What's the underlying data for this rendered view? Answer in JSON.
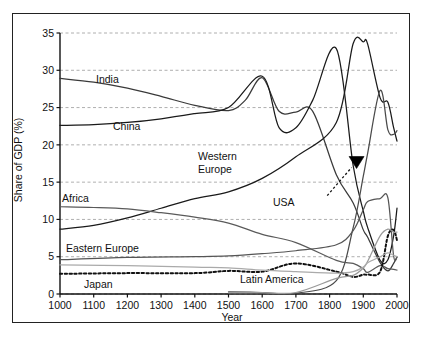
{
  "chart_data": {
    "type": "line",
    "title": "",
    "xlabel": "Year",
    "ylabel": "Share of GDP (%)",
    "xlim": [
      1000,
      2000
    ],
    "ylim": [
      0,
      35
    ],
    "xticks": [
      1000,
      1100,
      1200,
      1300,
      1400,
      1500,
      1600,
      1700,
      1800,
      1900,
      2000
    ],
    "yticks": [
      0,
      5,
      10,
      15,
      20,
      25,
      30,
      35
    ],
    "grid": "horizontal-dashed",
    "legend": "inline-annotations",
    "series": [
      {
        "name": "India",
        "label": "India",
        "style": "solid",
        "color": "#3a3a3a",
        "x": [
          1000,
          1100,
          1200,
          1300,
          1400,
          1500,
          1550,
          1600,
          1650,
          1700,
          1750,
          1820,
          1870,
          1900,
          1913,
          1950,
          1973,
          1990,
          2000
        ],
        "values": [
          28.9,
          28.4,
          27.6,
          26.5,
          25.3,
          24.6,
          26.0,
          29.0,
          24.5,
          24.4,
          24.5,
          16.0,
          12.2,
          8.6,
          7.6,
          4.2,
          3.1,
          4.1,
          5.0
        ]
      },
      {
        "name": "China",
        "label": "China",
        "style": "solid",
        "color": "#1a1a1a",
        "x": [
          1000,
          1100,
          1200,
          1300,
          1400,
          1500,
          1600,
          1650,
          1700,
          1750,
          1820,
          1870,
          1900,
          1913,
          1950,
          1973,
          1990,
          2000
        ],
        "values": [
          22.6,
          22.7,
          23.0,
          23.5,
          24.2,
          25.0,
          29.2,
          22.3,
          22.3,
          26.0,
          32.9,
          17.2,
          11.1,
          8.9,
          4.5,
          4.6,
          7.8,
          11.5
        ]
      },
      {
        "name": "Western Europe",
        "label": "Western\nEurope",
        "style": "solid",
        "color": "#1a1a1a",
        "x": [
          1000,
          1100,
          1200,
          1300,
          1400,
          1500,
          1600,
          1700,
          1820,
          1870,
          1900,
          1913,
          1950,
          1973,
          1990,
          2000
        ],
        "values": [
          8.7,
          9.2,
          10.2,
          11.5,
          12.8,
          13.7,
          15.5,
          18.4,
          23.0,
          33.6,
          33.8,
          33.5,
          26.3,
          25.7,
          22.3,
          20.5
        ]
      },
      {
        "name": "USA",
        "label": "USA",
        "style": "solid",
        "color": "#4a4a4a",
        "x": [
          1500,
          1600,
          1700,
          1820,
          1870,
          1900,
          1913,
          1950,
          1973,
          1990,
          2000
        ],
        "values": [
          0.3,
          0.2,
          0.1,
          1.8,
          8.9,
          15.8,
          18.9,
          27.3,
          22.0,
          21.4,
          21.9
        ]
      },
      {
        "name": "Africa",
        "label": "Africa",
        "style": "solid",
        "color": "#5a5a5a",
        "x": [
          1000,
          1100,
          1200,
          1300,
          1400,
          1500,
          1600,
          1700,
          1820,
          1870,
          1900,
          1913,
          1950,
          1973,
          1990,
          2000
        ],
        "values": [
          11.7,
          11.6,
          11.4,
          10.9,
          10.3,
          9.5,
          8.0,
          6.9,
          4.5,
          4.1,
          3.4,
          2.9,
          3.8,
          3.4,
          3.3,
          3.2
        ]
      },
      {
        "name": "Eastern Europe",
        "label": "Eastern Europe",
        "style": "solid",
        "color": "#555555",
        "x": [
          1000,
          1200,
          1400,
          1500,
          1600,
          1700,
          1820,
          1870,
          1900,
          1913,
          1950,
          1973,
          1990,
          2000
        ],
        "values": [
          4.6,
          4.9,
          5.0,
          5.1,
          5.4,
          5.8,
          6.6,
          8.5,
          11.3,
          12.4,
          12.8,
          12.9,
          5.1,
          4.9
        ]
      },
      {
        "name": "Japan",
        "label": "Japan",
        "style": "dotted",
        "color": "#111111",
        "x": [
          1000,
          1200,
          1400,
          1500,
          1600,
          1700,
          1820,
          1870,
          1900,
          1913,
          1950,
          1973,
          1990,
          2000
        ],
        "values": [
          2.7,
          2.8,
          2.8,
          3.1,
          3.0,
          4.1,
          3.0,
          2.3,
          2.6,
          2.6,
          3.0,
          7.8,
          8.6,
          7.2
        ]
      },
      {
        "name": "Latin America",
        "label": "Latin America",
        "style": "solid",
        "color": "#9a9a9a",
        "x": [
          1500,
          1600,
          1700,
          1820,
          1870,
          1900,
          1913,
          1950,
          1973,
          1990,
          2000
        ],
        "values": [
          0.2,
          0.2,
          0.2,
          2.1,
          2.5,
          3.5,
          4.4,
          7.8,
          8.7,
          8.3,
          8.3
        ]
      },
      {
        "name": "Other",
        "label": "",
        "style": "solid",
        "color": "#aaaaaa",
        "x": [
          1000,
          1200,
          1400,
          1500,
          1600,
          1700,
          1820,
          1870,
          1900,
          1913,
          1950,
          1973,
          1990,
          2000
        ],
        "values": [
          3.9,
          3.8,
          3.6,
          3.5,
          3.2,
          3.0,
          2.8,
          3.0,
          3.6,
          4.2,
          5.0,
          5.5,
          5.2,
          5.0
        ]
      }
    ],
    "annotations": [
      {
        "name": "usa-pointer",
        "label": "USA",
        "type": "dotted-arrow",
        "from_x": 1793,
        "from_y": 13.2,
        "to_x": 1880,
        "to_y": 17.5
      }
    ]
  },
  "axes": {
    "y_label": "Share of GDP (%)",
    "x_label": "Year",
    "y_ticks": [
      "0",
      "5",
      "10",
      "15",
      "20",
      "25",
      "30",
      "35"
    ],
    "x_ticks": [
      "1000",
      "1100",
      "1200",
      "1300",
      "1400",
      "1500",
      "1600",
      "1700",
      "1800",
      "1900",
      "2000"
    ]
  },
  "labels": {
    "india": "India",
    "china": "China",
    "western_europe_line1": "Western",
    "western_europe_line2": "Europe",
    "usa": "USA",
    "africa": "Africa",
    "eastern_europe": "Eastern Europe",
    "japan": "Japan",
    "latin_america": "Latin America"
  },
  "colors": {
    "background": "#ffffff",
    "frame": "#222222",
    "grid": "#9a9a9a",
    "axis": "#111111",
    "ink": "#1a1a1a"
  }
}
